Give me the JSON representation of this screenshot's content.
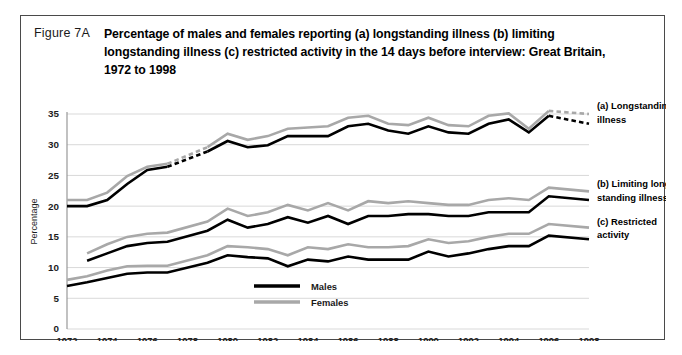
{
  "figure": {
    "number": "Figure 7A",
    "title": "Percentage of males and females reporting (a) longstanding illness (b) limiting longstanding illness  (c) restricted activity in the 14 days before interview:  Great Britain, 1972 to 1998"
  },
  "annotations": {
    "a_line1": "(a) Longstanding",
    "a_line2": "illness",
    "b_line1": "(b) Limiting long",
    "b_line2": "standing illness",
    "c_line1": "(c) Restricted",
    "c_line2": "activity"
  },
  "legend": {
    "males": "Males",
    "females": "Females"
  },
  "colors": {
    "males": "#000000",
    "females": "#a8a8a8",
    "grid": "#d9d9d9",
    "axis": "#8f8f8f",
    "border": "#4a4a4a"
  },
  "chart_data": {
    "type": "line",
    "title": "Percentage of males and females reporting (a) longstanding illness (b) limiting longstanding illness (c) restricted activity in the 14 days before interview: Great Britain, 1972 to 1998",
    "xlabel": "",
    "ylabel": "Percentage",
    "xlim": [
      1972,
      1998
    ],
    "ylim": [
      0,
      35
    ],
    "yticks": [
      0,
      5,
      10,
      15,
      20,
      25,
      30,
      35
    ],
    "xticks": [
      1972,
      1974,
      1976,
      1978,
      1980,
      1982,
      1984,
      1986,
      1988,
      1990,
      1992,
      1994,
      1996,
      1998
    ],
    "grid": true,
    "legend_position": "bottom-center",
    "groups": [
      {
        "id": "a",
        "name": "(a) Longstanding illness",
        "series": [
          {
            "name": "Males",
            "x": [
              1972,
              1973,
              1974,
              1975,
              1976,
              1977,
              1979,
              1980,
              1981,
              1982,
              1983,
              1984,
              1985,
              1986,
              1987,
              1988,
              1989,
              1990,
              1991,
              1992,
              1993,
              1994,
              1995,
              1996,
              1998
            ],
            "values": [
              20.0,
              20.0,
              21.0,
              23.6,
              25.9,
              26.4,
              28.9,
              30.6,
              29.6,
              29.9,
              31.4,
              31.4,
              31.4,
              33.0,
              33.4,
              32.3,
              31.8,
              33.0,
              32.0,
              31.8,
              33.4,
              34.1,
              32.0,
              34.7,
              33.4
            ],
            "dashed_segments": [
              [
                1977,
                1979
              ],
              [
                1996,
                1998
              ]
            ]
          },
          {
            "name": "Females",
            "x": [
              1972,
              1973,
              1974,
              1975,
              1976,
              1977,
              1979,
              1980,
              1981,
              1982,
              1983,
              1984,
              1985,
              1986,
              1987,
              1988,
              1989,
              1990,
              1991,
              1992,
              1993,
              1994,
              1995,
              1996,
              1998
            ],
            "values": [
              21.0,
              21.0,
              22.2,
              24.9,
              26.4,
              26.9,
              29.6,
              31.8,
              30.8,
              31.4,
              32.6,
              32.8,
              33.0,
              34.4,
              34.7,
              33.4,
              33.2,
              34.4,
              33.2,
              33.0,
              34.7,
              35.1,
              32.6,
              35.5,
              35.0
            ],
            "dashed_segments": [
              [
                1977,
                1979
              ],
              [
                1996,
                1998
              ]
            ]
          }
        ]
      },
      {
        "id": "b",
        "name": "(b) Limiting longstanding illness",
        "series": [
          {
            "name": "Males",
            "x": [
              1973,
              1974,
              1975,
              1976,
              1977,
              1979,
              1980,
              1981,
              1982,
              1983,
              1984,
              1985,
              1986,
              1987,
              1988,
              1989,
              1990,
              1991,
              1992,
              1993,
              1994,
              1995,
              1996,
              1998
            ],
            "values": [
              11.1,
              12.3,
              13.5,
              14.0,
              14.2,
              16.0,
              17.8,
              16.5,
              17.1,
              18.2,
              17.3,
              18.4,
              17.1,
              18.4,
              18.4,
              18.7,
              18.7,
              18.4,
              18.4,
              19.0,
              19.0,
              19.0,
              21.6,
              21.0
            ]
          },
          {
            "name": "Females",
            "x": [
              1973,
              1974,
              1975,
              1976,
              1977,
              1979,
              1980,
              1981,
              1982,
              1983,
              1984,
              1985,
              1986,
              1987,
              1988,
              1989,
              1990,
              1991,
              1992,
              1993,
              1994,
              1995,
              1996,
              1998
            ],
            "values": [
              12.3,
              13.8,
              15.0,
              15.5,
              15.7,
              17.5,
              19.6,
              18.4,
              19.0,
              20.2,
              19.3,
              20.5,
              19.3,
              20.8,
              20.5,
              20.8,
              20.5,
              20.2,
              20.2,
              21.0,
              21.3,
              21.0,
              23.0,
              22.4
            ]
          }
        ]
      },
      {
        "id": "c",
        "name": "(c) Restricted activity",
        "series": [
          {
            "name": "Males",
            "x": [
              1972,
              1973,
              1974,
              1975,
              1976,
              1977,
              1979,
              1980,
              1981,
              1982,
              1983,
              1984,
              1985,
              1986,
              1987,
              1988,
              1989,
              1990,
              1991,
              1992,
              1993,
              1994,
              1995,
              1996,
              1998
            ],
            "values": [
              7.0,
              7.6,
              8.3,
              9.0,
              9.2,
              9.2,
              10.8,
              12.0,
              11.7,
              11.5,
              10.2,
              11.3,
              11.0,
              11.8,
              11.3,
              11.3,
              11.3,
              12.6,
              11.8,
              12.3,
              13.0,
              13.5,
              13.5,
              15.2,
              14.6
            ]
          },
          {
            "name": "Females",
            "x": [
              1972,
              1973,
              1974,
              1975,
              1976,
              1977,
              1979,
              1980,
              1981,
              1982,
              1983,
              1984,
              1985,
              1986,
              1987,
              1988,
              1989,
              1990,
              1991,
              1992,
              1993,
              1994,
              1995,
              1996,
              1998
            ],
            "values": [
              8.0,
              8.6,
              9.5,
              10.2,
              10.3,
              10.3,
              12.0,
              13.5,
              13.3,
              13.0,
              12.0,
              13.3,
              13.0,
              13.8,
              13.3,
              13.3,
              13.5,
              14.6,
              14.0,
              14.3,
              15.0,
              15.5,
              15.5,
              17.1,
              16.5
            ]
          }
        ]
      }
    ]
  }
}
